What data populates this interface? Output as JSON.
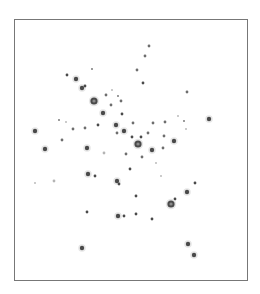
{
  "figure": {
    "colors": {
      "background": "#ffffff",
      "border": "#777777",
      "spot_dark": "#4a4a4a",
      "spot_mid": "#6e6e6e",
      "spot_faint": "#b4b4b4",
      "halo": "#dcdcdc"
    },
    "spots": [
      {
        "x": 149,
        "y": 46,
        "size": "small",
        "intensity": "mid"
      },
      {
        "x": 145,
        "y": 56,
        "size": "small",
        "intensity": "mid"
      },
      {
        "x": 137,
        "y": 70,
        "size": "small",
        "intensity": "mid"
      },
      {
        "x": 143,
        "y": 83,
        "size": "small",
        "intensity": "dark"
      },
      {
        "x": 92,
        "y": 69,
        "size": "tiny",
        "intensity": "mid"
      },
      {
        "x": 67,
        "y": 75,
        "size": "small",
        "intensity": "dark"
      },
      {
        "x": 76,
        "y": 79,
        "size": "medium",
        "intensity": "dark"
      },
      {
        "x": 82,
        "y": 88,
        "size": "medium",
        "intensity": "dark"
      },
      {
        "x": 85,
        "y": 86,
        "size": "small",
        "intensity": "dark"
      },
      {
        "x": 187,
        "y": 92,
        "size": "small",
        "intensity": "mid"
      },
      {
        "x": 94,
        "y": 101,
        "size": "large",
        "intensity": "dark"
      },
      {
        "x": 106,
        "y": 95,
        "size": "small",
        "intensity": "mid"
      },
      {
        "x": 112,
        "y": 90,
        "size": "tiny",
        "intensity": "faint"
      },
      {
        "x": 118,
        "y": 96,
        "size": "tiny",
        "intensity": "mid"
      },
      {
        "x": 121,
        "y": 101,
        "size": "small",
        "intensity": "mid"
      },
      {
        "x": 111,
        "y": 105,
        "size": "small",
        "intensity": "mid"
      },
      {
        "x": 103,
        "y": 113,
        "size": "medium",
        "intensity": "dark"
      },
      {
        "x": 122,
        "y": 114,
        "size": "small",
        "intensity": "dark"
      },
      {
        "x": 178,
        "y": 116,
        "size": "tiny",
        "intensity": "faint"
      },
      {
        "x": 184,
        "y": 121,
        "size": "tiny",
        "intensity": "mid"
      },
      {
        "x": 209,
        "y": 119,
        "size": "medium",
        "intensity": "dark"
      },
      {
        "x": 165,
        "y": 122,
        "size": "small",
        "intensity": "mid"
      },
      {
        "x": 153,
        "y": 123,
        "size": "small",
        "intensity": "mid"
      },
      {
        "x": 59,
        "y": 120,
        "size": "tiny",
        "intensity": "mid"
      },
      {
        "x": 66,
        "y": 122,
        "size": "tiny",
        "intensity": "faint"
      },
      {
        "x": 73,
        "y": 129,
        "size": "small",
        "intensity": "mid"
      },
      {
        "x": 85,
        "y": 128,
        "size": "small",
        "intensity": "mid"
      },
      {
        "x": 98,
        "y": 125,
        "size": "small",
        "intensity": "dark"
      },
      {
        "x": 116,
        "y": 125,
        "size": "medium",
        "intensity": "dark"
      },
      {
        "x": 133,
        "y": 123,
        "size": "small",
        "intensity": "mid"
      },
      {
        "x": 186,
        "y": 129,
        "size": "tiny",
        "intensity": "faint"
      },
      {
        "x": 35,
        "y": 131,
        "size": "medium",
        "intensity": "dark"
      },
      {
        "x": 124,
        "y": 131,
        "size": "medium",
        "intensity": "dark"
      },
      {
        "x": 117,
        "y": 133,
        "size": "small",
        "intensity": "mid"
      },
      {
        "x": 148,
        "y": 133,
        "size": "small",
        "intensity": "mid"
      },
      {
        "x": 132,
        "y": 137,
        "size": "small",
        "intensity": "dark"
      },
      {
        "x": 141,
        "y": 137,
        "size": "small",
        "intensity": "dark"
      },
      {
        "x": 138,
        "y": 144,
        "size": "large",
        "intensity": "dark"
      },
      {
        "x": 164,
        "y": 136,
        "size": "small",
        "intensity": "mid"
      },
      {
        "x": 174,
        "y": 141,
        "size": "medium",
        "intensity": "dark"
      },
      {
        "x": 62,
        "y": 140,
        "size": "small",
        "intensity": "mid"
      },
      {
        "x": 45,
        "y": 149,
        "size": "medium",
        "intensity": "dark"
      },
      {
        "x": 87,
        "y": 148,
        "size": "medium",
        "intensity": "dark"
      },
      {
        "x": 152,
        "y": 150,
        "size": "medium",
        "intensity": "dark"
      },
      {
        "x": 163,
        "y": 148,
        "size": "small",
        "intensity": "mid"
      },
      {
        "x": 104,
        "y": 153,
        "size": "small",
        "intensity": "faint"
      },
      {
        "x": 126,
        "y": 154,
        "size": "small",
        "intensity": "mid"
      },
      {
        "x": 142,
        "y": 157,
        "size": "small",
        "intensity": "mid"
      },
      {
        "x": 156,
        "y": 163,
        "size": "tiny",
        "intensity": "faint"
      },
      {
        "x": 130,
        "y": 169,
        "size": "small",
        "intensity": "dark"
      },
      {
        "x": 161,
        "y": 176,
        "size": "tiny",
        "intensity": "faint"
      },
      {
        "x": 88,
        "y": 174,
        "size": "medium",
        "intensity": "dark"
      },
      {
        "x": 95,
        "y": 176,
        "size": "small",
        "intensity": "dark"
      },
      {
        "x": 117,
        "y": 181,
        "size": "medium",
        "intensity": "dark"
      },
      {
        "x": 119,
        "y": 184,
        "size": "small",
        "intensity": "dark"
      },
      {
        "x": 35,
        "y": 183,
        "size": "tiny",
        "intensity": "faint"
      },
      {
        "x": 54,
        "y": 181,
        "size": "small",
        "intensity": "faint"
      },
      {
        "x": 195,
        "y": 183,
        "size": "small",
        "intensity": "dark"
      },
      {
        "x": 187,
        "y": 192,
        "size": "medium",
        "intensity": "dark"
      },
      {
        "x": 136,
        "y": 196,
        "size": "small",
        "intensity": "dark"
      },
      {
        "x": 175,
        "y": 199,
        "size": "small",
        "intensity": "dark"
      },
      {
        "x": 171,
        "y": 204,
        "size": "large",
        "intensity": "dark"
      },
      {
        "x": 87,
        "y": 212,
        "size": "small",
        "intensity": "dark"
      },
      {
        "x": 118,
        "y": 216,
        "size": "medium",
        "intensity": "dark"
      },
      {
        "x": 124,
        "y": 216,
        "size": "small",
        "intensity": "dark"
      },
      {
        "x": 136,
        "y": 214,
        "size": "small",
        "intensity": "dark"
      },
      {
        "x": 152,
        "y": 219,
        "size": "small",
        "intensity": "dark"
      },
      {
        "x": 82,
        "y": 248,
        "size": "medium",
        "intensity": "dark"
      },
      {
        "x": 188,
        "y": 244,
        "size": "medium",
        "intensity": "dark"
      },
      {
        "x": 194,
        "y": 255,
        "size": "medium",
        "intensity": "dark"
      }
    ]
  }
}
